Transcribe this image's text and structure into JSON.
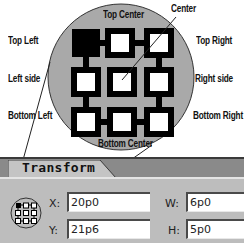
{
  "callouts": {
    "top_left": "Top Left",
    "top_center": "Top Center",
    "center": "Center",
    "top_right": "Top Right",
    "left_side": "Left side",
    "right_side": "Right side",
    "bottom_left": "Bottom Left",
    "bottom_right": "Bottom Right",
    "bottom_center": "Bottom Center"
  },
  "panel": {
    "title": "Transform",
    "fields": {
      "x": {
        "label": "X:",
        "value": "20p0"
      },
      "y": {
        "label": "Y:",
        "value": "21p6"
      },
      "w": {
        "label": "W:",
        "value": "6p0"
      },
      "h": {
        "label": "H:",
        "value": "5p0"
      }
    },
    "reference_point": {
      "selected": "top-left"
    }
  },
  "colors": {
    "circle_fill": "#a9a9a9",
    "panel_bg": "#bdbdbd",
    "panel_band": "#8a8a8a",
    "selected_square": "#000000"
  }
}
